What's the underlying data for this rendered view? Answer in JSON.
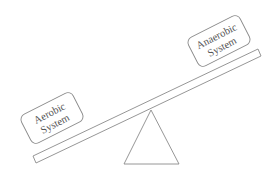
{
  "diagram": {
    "type": "seesaw",
    "left_box": {
      "line1": "Aerobic",
      "line2": "System"
    },
    "right_box": {
      "line1": "Anaerobic",
      "line2": "System"
    },
    "colors": {
      "stroke": "#8a8a8a",
      "text": "#555555",
      "background": "#ffffff"
    }
  }
}
